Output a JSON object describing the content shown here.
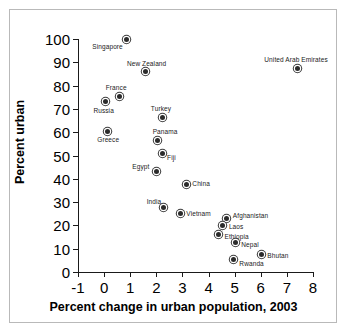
{
  "chart_data": {
    "type": "scatter",
    "title": "",
    "xlabel": "Percent change in urban population, 2003",
    "ylabel": "Percent urban",
    "xlim": [
      -1,
      8
    ],
    "ylim": [
      0,
      100
    ],
    "xticks": [
      "-1",
      "0",
      "1",
      "2",
      "3",
      "4",
      "5",
      "6",
      "7",
      "8"
    ],
    "yticks": [
      "0",
      "10",
      "20",
      "30",
      "40",
      "50",
      "60",
      "70",
      "80",
      "90",
      "100"
    ],
    "grid": false,
    "legend": null,
    "marker_color": "#2b2b2b",
    "points": [
      {
        "label": "Singapore",
        "x": 0.85,
        "y": 100.0,
        "lx": -34,
        "ly": 5
      },
      {
        "label": "United Arab Emirates",
        "x": 7.4,
        "y": 87.5,
        "lx": -33,
        "ly": -11
      },
      {
        "label": "New Zealand",
        "x": 1.6,
        "y": 86.0,
        "lx": -19,
        "ly": -11
      },
      {
        "label": "France",
        "x": 0.6,
        "y": 75.5,
        "lx": -14,
        "ly": -11
      },
      {
        "label": "Russia",
        "x": 0.05,
        "y": 73.0,
        "lx": -12,
        "ly": 6
      },
      {
        "label": "Turkey",
        "x": 2.25,
        "y": 66.5,
        "lx": -12,
        "ly": -11
      },
      {
        "label": "Greece",
        "x": 0.12,
        "y": 60.5,
        "lx": -10,
        "ly": 6
      },
      {
        "label": "Panama",
        "x": 2.05,
        "y": 56.5,
        "lx": -5,
        "ly": -11
      },
      {
        "label": "Fiji",
        "x": 2.22,
        "y": 51.0,
        "lx": 5,
        "ly": 2
      },
      {
        "label": "Egypt",
        "x": 2.0,
        "y": 43.0,
        "lx": -24,
        "ly": -8
      },
      {
        "label": "China",
        "x": 3.15,
        "y": 37.5,
        "lx": 6,
        "ly": -4
      },
      {
        "label": "India",
        "x": 2.28,
        "y": 27.5,
        "lx": -17,
        "ly": -9
      },
      {
        "label": "Vietnam",
        "x": 2.92,
        "y": 25.0,
        "lx": 6,
        "ly": -3
      },
      {
        "label": "Afghanistan",
        "x": 4.7,
        "y": 23.0,
        "lx": 6,
        "ly": -5
      },
      {
        "label": "Laos",
        "x": 4.55,
        "y": 20.0,
        "lx": 6,
        "ly": -1
      },
      {
        "label": "Ethiopia",
        "x": 4.38,
        "y": 16.0,
        "lx": 6,
        "ly": -1
      },
      {
        "label": "Nepal",
        "x": 5.02,
        "y": 12.5,
        "lx": 6,
        "ly": -1
      },
      {
        "label": "Bhutan",
        "x": 6.02,
        "y": 7.5,
        "lx": 6,
        "ly": -2
      },
      {
        "label": "Rwanda",
        "x": 4.95,
        "y": 5.5,
        "lx": 6,
        "ly": 2
      }
    ]
  }
}
